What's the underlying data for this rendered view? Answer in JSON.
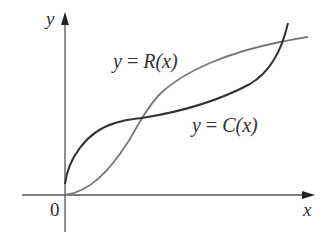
{
  "figure": {
    "axes": {
      "x_label": "x",
      "y_label": "y",
      "origin_label": "0",
      "axis_color": "#555555"
    },
    "curves": [
      {
        "name": "revenue",
        "label_lhs": "y",
        "label_eq": " = ",
        "label_fn": "R",
        "label_arg": "(x)",
        "full_label": "y = R(x)",
        "color": "#7a7a7a"
      },
      {
        "name": "cost",
        "label_lhs": "y",
        "label_eq": " = ",
        "label_fn": "C",
        "label_arg": "(x)",
        "full_label": "y = C(x)",
        "color": "#3a3a3a"
      }
    ]
  }
}
